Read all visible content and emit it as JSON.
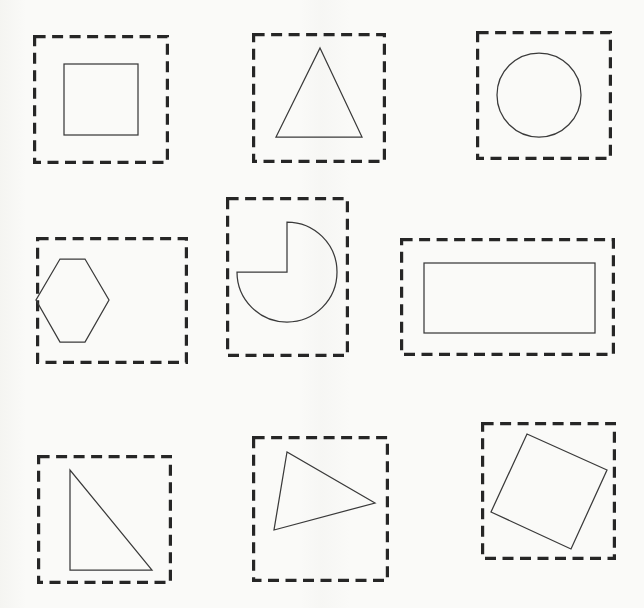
{
  "page": {
    "background_color": "#fafaf8",
    "width": 644,
    "height": 608,
    "frame_color": "#262626",
    "shape_color": "#3a3a3a"
  },
  "grid": {
    "rows": 3,
    "columns": 3,
    "cell_count": 9
  },
  "chart_data": {
    "type": "table",
    "xlabel": "",
    "ylabel": "",
    "categories": [
      "square",
      "triangle-equilateral",
      "circle",
      "hexagon",
      "pie-three-quarters",
      "rectangle",
      "triangle-right",
      "triangle-scalene",
      "square-rotated"
    ],
    "values": [
      4,
      3,
      0,
      6,
      2,
      4,
      3,
      3,
      4
    ]
  },
  "shapes": [
    {
      "id": "shape-square",
      "name": "square",
      "label": "Square",
      "sides": 4,
      "row": 1,
      "column": 1,
      "frame": {
        "x": 33,
        "y": 35,
        "width": 136,
        "height": 129
      },
      "geometry": {
        "kind": "rect",
        "x": 31,
        "y": 29,
        "width": 74,
        "height": 71,
        "rotation": 0
      }
    },
    {
      "id": "shape-triangle-equilateral",
      "name": "triangle-equilateral",
      "label": "Equilateral Triangle",
      "sides": 3,
      "row": 1,
      "column": 2,
      "frame": {
        "x": 252,
        "y": 33,
        "width": 134,
        "height": 130
      },
      "geometry": {
        "kind": "polygon",
        "points": "68,15 110,104 24,104",
        "rotation": 0
      }
    },
    {
      "id": "shape-circle",
      "name": "circle",
      "label": "Circle",
      "sides": 0,
      "row": 1,
      "column": 3,
      "frame": {
        "x": 476,
        "y": 31,
        "width": 136,
        "height": 129
      },
      "geometry": {
        "kind": "circle",
        "cx": 63,
        "cy": 64,
        "r": 42,
        "rotation": 0
      }
    },
    {
      "id": "shape-hexagon",
      "name": "hexagon",
      "label": "Hexagon",
      "sides": 6,
      "row": 2,
      "column": 1,
      "frame": {
        "x": 36,
        "y": 237,
        "width": 152,
        "height": 127
      },
      "geometry": {
        "kind": "polygon",
        "points": "49,22 24,22 0,63 24,105 49,105 73,63",
        "rotation": 0
      }
    },
    {
      "id": "shape-pie-three-quarters",
      "name": "pie-three-quarters",
      "label": "Three-quarter Pie",
      "sides": 2,
      "row": 2,
      "column": 2,
      "frame": {
        "x": 226,
        "y": 197,
        "width": 123,
        "height": 160
      },
      "geometry": {
        "kind": "pie",
        "cx": 61,
        "cy": 75,
        "r": 50,
        "start_angle_deg": 270,
        "sweep_deg": 270,
        "rotation": 0
      }
    },
    {
      "id": "shape-rectangle",
      "name": "rectangle",
      "label": "Rectangle",
      "sides": 4,
      "row": 2,
      "column": 3,
      "frame": {
        "x": 400,
        "y": 238,
        "width": 215,
        "height": 118
      },
      "geometry": {
        "kind": "rect",
        "x": 24,
        "y": 25,
        "width": 171,
        "height": 70,
        "rotation": 0
      }
    },
    {
      "id": "shape-triangle-right",
      "name": "triangle-right",
      "label": "Right Triangle",
      "sides": 3,
      "row": 3,
      "column": 1,
      "frame": {
        "x": 37,
        "y": 455,
        "width": 135,
        "height": 129
      },
      "geometry": {
        "kind": "polygon",
        "points": "33,15 33,115 115,115",
        "rotation": 0
      }
    },
    {
      "id": "shape-triangle-scalene",
      "name": "triangle-scalene",
      "label": "Scalene Triangle",
      "sides": 3,
      "row": 3,
      "column": 2,
      "frame": {
        "x": 252,
        "y": 436,
        "width": 137,
        "height": 146
      },
      "geometry": {
        "kind": "polygon",
        "points": "35,16 22,94 123,67",
        "rotation": 0
      }
    },
    {
      "id": "shape-square-rotated",
      "name": "square-rotated",
      "label": "Rotated Square",
      "sides": 4,
      "row": 3,
      "column": 3,
      "frame": {
        "x": 481,
        "y": 422,
        "width": 135,
        "height": 138
      },
      "geometry": {
        "kind": "polygon",
        "points": "46,12 126,48 90,127 10,90",
        "rotation": 24
      }
    }
  ]
}
